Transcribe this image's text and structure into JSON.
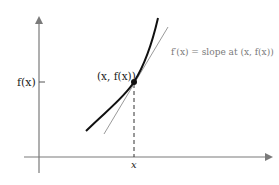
{
  "diagram": {
    "title": "",
    "axes": {
      "y_axis_label": "f(x)",
      "x_axis_label": "x"
    },
    "point": {
      "label": "(x, f(x))"
    },
    "tangent": {
      "annotation": "f′(x) = slope at (x, f(x))"
    },
    "colors": {
      "axis": "#7a7a7a",
      "curve": "#111111",
      "tangent": "#9a9a9a",
      "dashed": "#333333",
      "text": "#222222",
      "annotation": "#7a7a7a"
    }
  }
}
